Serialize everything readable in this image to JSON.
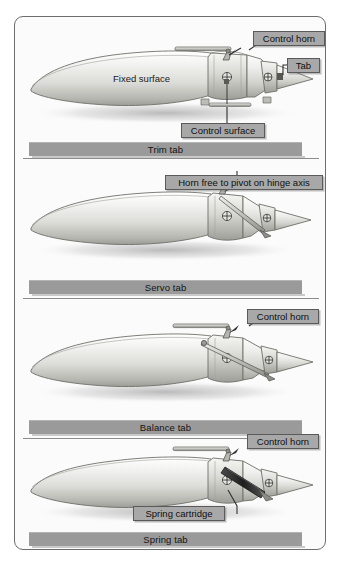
{
  "figure": {
    "panel_count": 4
  },
  "colors": {
    "frame_border": "#6d6d6d",
    "caption_bar": "#9a9a9a",
    "label_box": "#a8a8a8",
    "label_border": "#5a5a5a",
    "surface_light": "#f2f2f0",
    "surface_mid": "#cfcfcb",
    "surface_dark": "#8f8f8a",
    "spring_cartridge": "#3a3a3a",
    "leader_line": "#2f2f2f",
    "background": "#fbfbfb"
  },
  "panels": [
    {
      "id": "trim-tab",
      "caption": "Trim tab",
      "surface_text": "Fixed surface",
      "labels": [
        {
          "name": "control-horn",
          "text": "Control horn"
        },
        {
          "name": "tab",
          "text": "Tab"
        },
        {
          "name": "control-surface",
          "text": "Control surface"
        }
      ]
    },
    {
      "id": "servo-tab",
      "caption": "Servo tab",
      "surface_text": "",
      "labels": [
        {
          "name": "horn-pivot-note",
          "text": "Horn free to pivot on hinge axis"
        }
      ]
    },
    {
      "id": "balance-tab",
      "caption": "Balance tab",
      "surface_text": "",
      "labels": [
        {
          "name": "control-horn",
          "text": "Control horn"
        }
      ]
    },
    {
      "id": "spring-tab",
      "caption": "Spring tab",
      "surface_text": "",
      "labels": [
        {
          "name": "control-horn",
          "text": "Control horn"
        },
        {
          "name": "spring-cartridge",
          "text": "Spring cartridge"
        }
      ]
    }
  ]
}
